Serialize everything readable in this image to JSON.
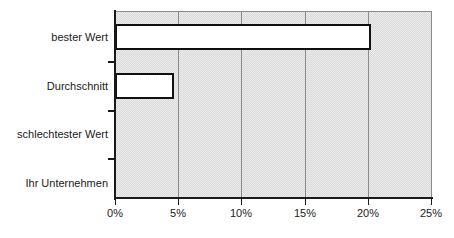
{
  "chart_data": {
    "type": "bar",
    "orientation": "horizontal",
    "title": "",
    "subtitle": "",
    "xlabel": "",
    "ylabel": "",
    "categories": [
      "bester Wert",
      "Durchschnitt",
      "schlechtester Wert",
      "Ihr Unternehmen"
    ],
    "values": [
      20.0,
      4.6,
      0,
      0
    ],
    "value_suffix": "%",
    "xlim": [
      0,
      25
    ],
    "xticks": [
      0,
      5,
      10,
      15,
      20,
      25
    ],
    "xtick_labels": [
      "0%",
      "5%",
      "10%",
      "15%",
      "20%",
      "25%"
    ],
    "grid": {
      "vertical": true,
      "horizontal": false,
      "color": "#8a8a8a"
    },
    "legend": {
      "visible": false,
      "position": "none",
      "entries": []
    },
    "annotations": [],
    "series": [
      {
        "name": "Wert",
        "values": [
          20.0,
          4.6,
          0,
          0
        ]
      }
    ],
    "style": {
      "plot_background": "#d8d8d8",
      "bar_fill": "#ffffff",
      "bar_border": "#101010",
      "axis_color": "#1a1a1a",
      "text_color": "#1a1a1a",
      "page_background": "#ffffff"
    }
  },
  "axis": {
    "y": {
      "ticks": [
        {
          "label": "bester Wert"
        },
        {
          "label": "Durchschnitt"
        },
        {
          "label": "schlechtester Wert"
        },
        {
          "label": "Ihr Unternehmen"
        }
      ]
    },
    "x": {
      "ticks": [
        {
          "label": "0%"
        },
        {
          "label": "5%"
        },
        {
          "label": "10%"
        },
        {
          "label": "15%"
        },
        {
          "label": "20%"
        },
        {
          "label": "25%"
        }
      ]
    }
  }
}
